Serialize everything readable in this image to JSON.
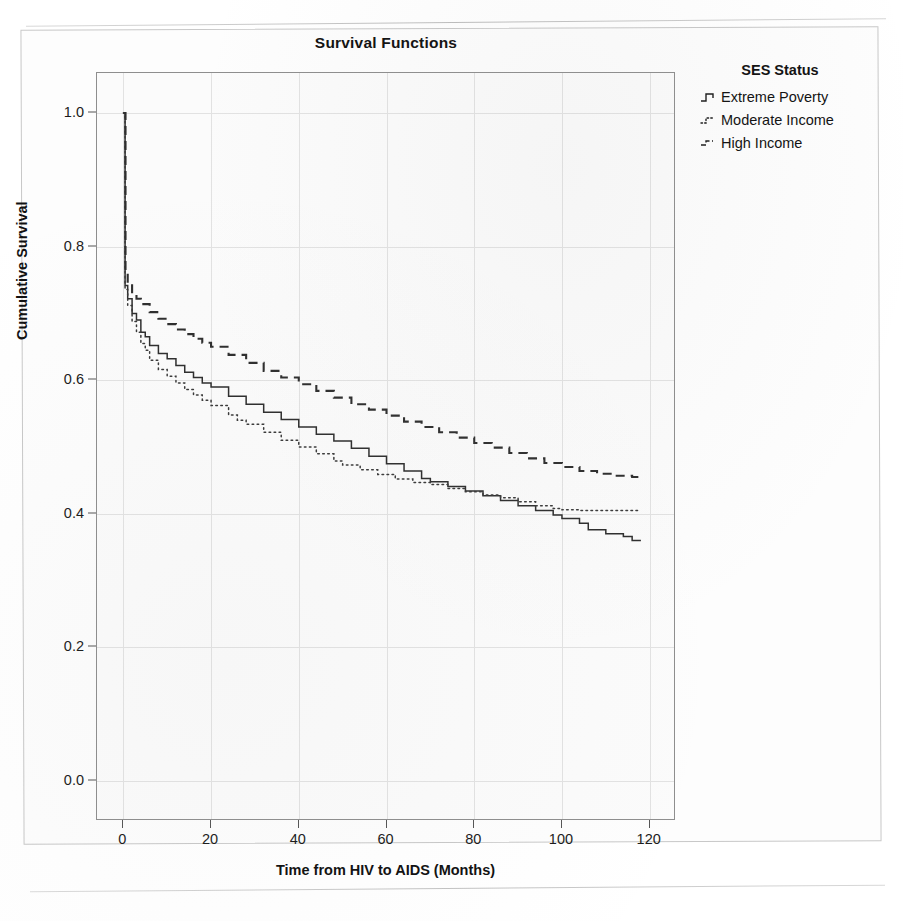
{
  "chart_data": {
    "type": "line",
    "title": "Survival Functions",
    "xlabel": "Time from HIV to AIDS (Months)",
    "ylabel": "Cumulative Survival",
    "xlim": [
      -6,
      126
    ],
    "ylim": [
      -0.06,
      1.06
    ],
    "xticks": [
      0,
      20,
      40,
      60,
      80,
      100,
      120
    ],
    "yticks": [
      0.0,
      0.2,
      0.4,
      0.6,
      0.8,
      1.0
    ],
    "ytick_labels": [
      "0.0",
      "0.2",
      "0.4",
      "0.6",
      "0.8",
      "1.0"
    ],
    "xtick_labels": [
      "0",
      "20",
      "40",
      "60",
      "80",
      "100",
      "120"
    ],
    "grid": true,
    "legend_title": "SES Status",
    "legend_position": "right-outside",
    "series": [
      {
        "name": "Extreme Poverty",
        "style": "solid",
        "color": "#2e2e2e",
        "points": [
          [
            0,
            1.0
          ],
          [
            0.4,
            0.742
          ],
          [
            1,
            0.722
          ],
          [
            2,
            0.7
          ],
          [
            3,
            0.69
          ],
          [
            4,
            0.672
          ],
          [
            5,
            0.665
          ],
          [
            6,
            0.652
          ],
          [
            8,
            0.64
          ],
          [
            10,
            0.632
          ],
          [
            12,
            0.622
          ],
          [
            14,
            0.612
          ],
          [
            16,
            0.604
          ],
          [
            18,
            0.596
          ],
          [
            20,
            0.59
          ],
          [
            24,
            0.576
          ],
          [
            28,
            0.564
          ],
          [
            32,
            0.552
          ],
          [
            36,
            0.541
          ],
          [
            40,
            0.53
          ],
          [
            44,
            0.519
          ],
          [
            48,
            0.509
          ],
          [
            52,
            0.498
          ],
          [
            56,
            0.486
          ],
          [
            60,
            0.475
          ],
          [
            64,
            0.464
          ],
          [
            68,
            0.453
          ],
          [
            70,
            0.448
          ],
          [
            74,
            0.441
          ],
          [
            78,
            0.434
          ],
          [
            82,
            0.427
          ],
          [
            86,
            0.42
          ],
          [
            90,
            0.412
          ],
          [
            94,
            0.405
          ],
          [
            98,
            0.398
          ],
          [
            100,
            0.393
          ],
          [
            104,
            0.386
          ],
          [
            106,
            0.376
          ],
          [
            110,
            0.37
          ],
          [
            114,
            0.366
          ],
          [
            116,
            0.36
          ],
          [
            118,
            0.36
          ]
        ]
      },
      {
        "name": "Moderate Income",
        "style": "dotted",
        "color": "#3a3a3a",
        "points": [
          [
            0,
            1.0
          ],
          [
            0.4,
            0.736
          ],
          [
            1,
            0.712
          ],
          [
            2,
            0.688
          ],
          [
            3,
            0.672
          ],
          [
            4,
            0.655
          ],
          [
            5,
            0.645
          ],
          [
            6,
            0.63
          ],
          [
            8,
            0.616
          ],
          [
            10,
            0.606
          ],
          [
            12,
            0.596
          ],
          [
            14,
            0.586
          ],
          [
            16,
            0.578
          ],
          [
            18,
            0.57
          ],
          [
            20,
            0.562
          ],
          [
            24,
            0.548
          ],
          [
            26,
            0.54
          ],
          [
            28,
            0.534
          ],
          [
            32,
            0.522
          ],
          [
            36,
            0.51
          ],
          [
            40,
            0.5
          ],
          [
            44,
            0.49
          ],
          [
            48,
            0.479
          ],
          [
            50,
            0.473
          ],
          [
            54,
            0.466
          ],
          [
            58,
            0.459
          ],
          [
            62,
            0.452
          ],
          [
            66,
            0.447
          ],
          [
            70,
            0.444
          ],
          [
            74,
            0.438
          ],
          [
            78,
            0.433
          ],
          [
            82,
            0.428
          ],
          [
            86,
            0.424
          ],
          [
            90,
            0.418
          ],
          [
            94,
            0.412
          ],
          [
            98,
            0.408
          ],
          [
            100,
            0.406
          ],
          [
            104,
            0.405
          ],
          [
            110,
            0.405
          ],
          [
            116,
            0.405
          ],
          [
            118,
            0.405
          ]
        ]
      },
      {
        "name": "High Income",
        "style": "dashed",
        "color": "#2e2e2e",
        "points": [
          [
            0,
            1.0
          ],
          [
            0.5,
            0.76
          ],
          [
            1,
            0.745
          ],
          [
            2,
            0.73
          ],
          [
            3,
            0.722
          ],
          [
            4,
            0.714
          ],
          [
            6,
            0.702
          ],
          [
            8,
            0.692
          ],
          [
            10,
            0.684
          ],
          [
            12,
            0.676
          ],
          [
            14,
            0.669
          ],
          [
            16,
            0.662
          ],
          [
            18,
            0.656
          ],
          [
            20,
            0.65
          ],
          [
            24,
            0.638
          ],
          [
            28,
            0.626
          ],
          [
            32,
            0.614
          ],
          [
            36,
            0.604
          ],
          [
            40,
            0.594
          ],
          [
            44,
            0.584
          ],
          [
            48,
            0.574
          ],
          [
            52,
            0.564
          ],
          [
            56,
            0.556
          ],
          [
            60,
            0.547
          ],
          [
            64,
            0.538
          ],
          [
            68,
            0.53
          ],
          [
            72,
            0.522
          ],
          [
            76,
            0.514
          ],
          [
            80,
            0.506
          ],
          [
            84,
            0.499
          ],
          [
            88,
            0.491
          ],
          [
            92,
            0.483
          ],
          [
            96,
            0.476
          ],
          [
            100,
            0.47
          ],
          [
            104,
            0.464
          ],
          [
            108,
            0.46
          ],
          [
            112,
            0.457
          ],
          [
            116,
            0.455
          ],
          [
            118,
            0.455
          ]
        ]
      }
    ]
  },
  "chart": {
    "title": "Survival Functions",
    "x_axis_title": "Time from HIV to AIDS (Months)",
    "y_axis_title": "Cumulative Survival"
  },
  "legend": {
    "title": "SES Status",
    "items": [
      {
        "label": "Extreme Poverty",
        "style": "solid"
      },
      {
        "label": "Moderate Income",
        "style": "dotted"
      },
      {
        "label": "High Income",
        "style": "dashed"
      }
    ]
  }
}
